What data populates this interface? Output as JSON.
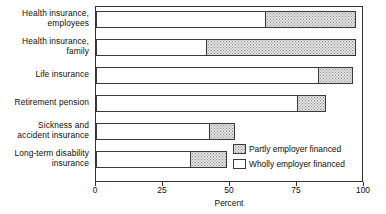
{
  "chart_data": {
    "type": "bar",
    "orientation": "horizontal",
    "stacked": true,
    "title": "",
    "xlabel": "Percent",
    "ylabel": "",
    "xlim": [
      0,
      100
    ],
    "xticks": [
      0,
      25,
      50,
      75,
      100
    ],
    "xtick_labels": [
      "0",
      "25",
      "50",
      "75",
      "100"
    ],
    "grid": false,
    "legend_position": "inside-bottom-right",
    "categories": [
      "Health insurance, employees",
      "Health insurance, family",
      "Life insurance",
      "Retirement pension",
      "Sickness and accident insurance",
      "Long-term disability insurance"
    ],
    "series": [
      {
        "name": "Wholly employer financed",
        "fill": "white",
        "values": [
          63,
          41,
          83,
          75,
          42,
          35
        ]
      },
      {
        "name": "Partly employer financed",
        "fill": "stipple",
        "values": [
          34,
          56,
          13,
          11,
          10,
          14
        ]
      }
    ],
    "totals": [
      97,
      97,
      96,
      86,
      52,
      49
    ]
  },
  "labels": {
    "categories": [
      {
        "line1": "Health insurance,",
        "line2": "employees"
      },
      {
        "line1": "Health insurance,",
        "line2": "family"
      },
      {
        "line1": "Life insurance",
        "line2": ""
      },
      {
        "line1": "Retirement pension",
        "line2": ""
      },
      {
        "line1": "Sickness and",
        "line2": "accident insurance"
      },
      {
        "line1": "Long-term disability",
        "line2": "insurance"
      }
    ]
  },
  "axis": {
    "title": "Percent",
    "ticks": [
      "0",
      "25",
      "50",
      "75",
      "100"
    ]
  },
  "legend": {
    "items": [
      {
        "label": "Partly employer financed",
        "swatch": "partly"
      },
      {
        "label": "Wholly employer financed",
        "swatch": "wholly"
      }
    ]
  },
  "colors": {
    "axis": "#333333",
    "text": "#0d0d0d",
    "stipple_bg": "#e3e3e3",
    "stipple_dot": "#8a8a8a",
    "wholly_fill": "#ffffff"
  }
}
